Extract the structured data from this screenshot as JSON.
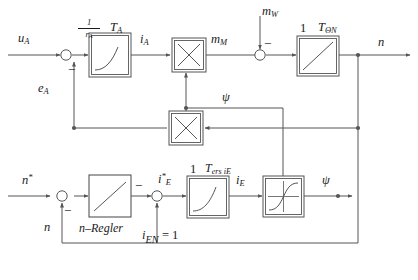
{
  "diagram": {
    "type": "control-block-diagram",
    "background_color": "#ffffff",
    "line_color": "#555555",
    "text_color": "#1a1a1a",
    "signals": {
      "u_a": {
        "base": "u",
        "sub": "A"
      },
      "e_a": {
        "base": "e",
        "sub": "A"
      },
      "i_a": {
        "base": "i",
        "sub": "A"
      },
      "m_m": {
        "base": "m",
        "sub": "M"
      },
      "m_w": {
        "base": "m",
        "sub": "W"
      },
      "n": {
        "base": "n",
        "sub": ""
      },
      "n_ref": {
        "base": "n",
        "sub": "",
        "sup": "*"
      },
      "psi": {
        "base": "ψ",
        "sub": ""
      },
      "i_e_ref": {
        "base": "i",
        "sub": "E",
        "sup": "*"
      },
      "i_e": {
        "base": "i",
        "sub": "E"
      }
    },
    "blocks": [
      {
        "id": "armature-lag",
        "label_top_left_fraction": {
          "numerator": "1",
          "denominator_base": "r",
          "denominator_sub": "A"
        },
        "label_top_right_base": "T",
        "label_top_right_sub": "A",
        "curve": "saturating-exponential",
        "border": "double"
      },
      {
        "id": "torque-multiplier",
        "glyph": "×",
        "border": "double"
      },
      {
        "id": "emf-multiplier",
        "glyph": "×",
        "border": "double"
      },
      {
        "id": "inertia-integrator",
        "label_top_left": "1",
        "label_top_right_base": "T",
        "label_top_right_sub": "ΘN",
        "curve": "rising-straight-line",
        "border": "double"
      },
      {
        "id": "speed-controller",
        "label_below": "n–Regler",
        "curve": "rising-straight-line",
        "border": "single"
      },
      {
        "id": "field-lag",
        "label_top_left": "1",
        "label_top_right_base": "T",
        "label_top_right_sub": "ers i",
        "label_top_right_sub2": "E",
        "curve": "saturating-exponential",
        "border": "double"
      },
      {
        "id": "magnetization-saturation",
        "curve": "s-shaped-saturation-through-origin",
        "border": "double"
      }
    ],
    "summing_junctions": [
      {
        "id": "armature-sum",
        "signs": [
          "-"
        ]
      },
      {
        "id": "load-torque-sum",
        "signs": [
          "-"
        ]
      },
      {
        "id": "speed-error-sum",
        "signs": [
          "-"
        ]
      },
      {
        "id": "field-current-sum",
        "signs": [
          "-"
        ]
      }
    ],
    "constants": {
      "i_en": {
        "base": "i",
        "sub": "EN",
        "operator": "=",
        "value": "1"
      }
    },
    "labels": {
      "n_regler": "n–Regler"
    }
  }
}
